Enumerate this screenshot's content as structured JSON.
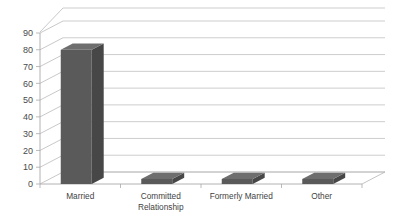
{
  "chart_data": {
    "type": "bar",
    "title": "",
    "subtitle": "",
    "xlabel": "",
    "ylabel": "",
    "categories": [
      "Married",
      "Committed Relationship",
      "Formerly Married",
      "Other"
    ],
    "category_lines": [
      [
        "Married"
      ],
      [
        "Committed",
        "Relationship"
      ],
      [
        "Formerly Married"
      ],
      [
        "Other"
      ]
    ],
    "values": [
      80,
      3,
      3,
      3
    ],
    "ylim": [
      0,
      90
    ],
    "ytick_labels": [
      "0",
      "10",
      "20",
      "30",
      "40",
      "50",
      "60",
      "70",
      "80",
      "90"
    ],
    "ytick_values": [
      0,
      10,
      20,
      30,
      40,
      50,
      60,
      70,
      80,
      90
    ],
    "grid": true,
    "legend": "none",
    "style": "3d-column",
    "series": [
      {
        "name": "Relationship Status",
        "values": [
          80,
          3,
          3,
          3
        ]
      }
    ]
  },
  "colors": {
    "bar_front": "#5a5a5a",
    "bar_top": "#6e6e6e",
    "bar_side": "#474747",
    "gridline": "#b8b8b8",
    "axis": "#a9a9a9",
    "background": "#ffffff",
    "label_text": "#4a4a4a"
  }
}
